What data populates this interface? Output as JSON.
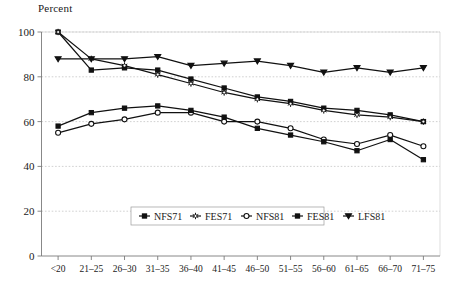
{
  "chart_data": {
    "type": "line",
    "title": "Percent",
    "xlabel": "",
    "ylabel": "Percent",
    "ylim": [
      0,
      100
    ],
    "yticks": [
      0,
      20,
      40,
      60,
      80,
      100
    ],
    "grid": true,
    "legend_position": "bottom-center-inside",
    "categories": [
      "<20",
      "21–25",
      "26–30",
      "31–35",
      "36–40",
      "41–45",
      "46–50",
      "51–55",
      "56–60",
      "61–65",
      "66–70",
      "71–75"
    ],
    "series": [
      {
        "name": "NFS71",
        "marker": "filled-square",
        "values": [
          100,
          83,
          84,
          83,
          79,
          75,
          71,
          69,
          66,
          65,
          63,
          60
        ]
      },
      {
        "name": "FES71",
        "marker": "open-star",
        "values": [
          100,
          88,
          85,
          81,
          77,
          73,
          70,
          68,
          65,
          63,
          62,
          60
        ]
      },
      {
        "name": "NFS81",
        "marker": "open-circle",
        "values": [
          55,
          59,
          61,
          64,
          64,
          60,
          60,
          57,
          52,
          50,
          54,
          49
        ]
      },
      {
        "name": "FES81",
        "marker": "filled-square",
        "values": [
          58,
          64,
          66,
          67,
          65,
          62,
          57,
          54,
          51,
          47,
          52,
          43
        ]
      },
      {
        "name": "LFS81",
        "marker": "filled-triangle",
        "values": [
          88,
          88,
          88,
          89,
          85,
          86,
          87,
          85,
          82,
          84,
          82,
          84
        ]
      }
    ]
  },
  "axis": {
    "y_title": "Percent",
    "y_tick_labels": [
      "100",
      "80",
      "60",
      "40",
      "20",
      "0"
    ],
    "x_tick_labels": [
      "<20",
      "21–25",
      "26–30",
      "31–35",
      "36–40",
      "41–45",
      "46–50",
      "51–55",
      "56–60",
      "61–65",
      "66–70",
      "71–75"
    ]
  },
  "legend": {
    "entries": [
      {
        "label": "NFS71",
        "marker": "filled-square"
      },
      {
        "label": "FES71",
        "marker": "open-star"
      },
      {
        "label": "NFS81",
        "marker": "open-circle"
      },
      {
        "label": "FES81",
        "marker": "filled-square"
      },
      {
        "label": "LFS81",
        "marker": "filled-triangle"
      }
    ]
  },
  "colors": {
    "ink": "#111111",
    "grid": "#bdbdbd",
    "axis": "#7a7a7a",
    "background": "#ffffff"
  }
}
